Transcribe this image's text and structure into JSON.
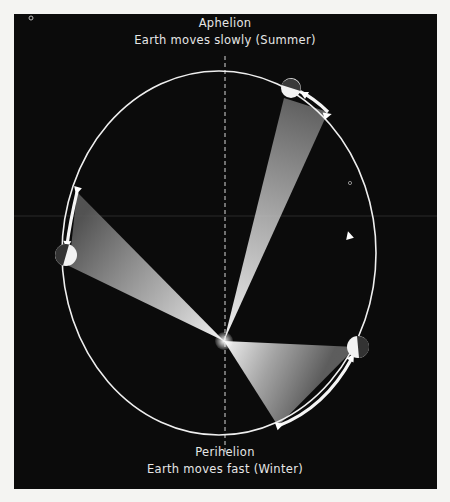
{
  "diagram": {
    "type": "orbit-diagram",
    "colors": {
      "background": "#0b0b0b",
      "page": "#f4f4f2",
      "orbit": "#f0f0f0",
      "sector_light": "#e8e8e8",
      "earth_day": "#f2f2f2",
      "earth_night": "#3a3a3a"
    },
    "aphelion": {
      "title": "Aphelion",
      "subtitle": "Earth moves slowly (Summer)"
    },
    "perihelion": {
      "title": "Perihelion",
      "subtitle": "Earth moves fast (Winter)"
    },
    "sun_focus": {
      "x": 224,
      "y": 341
    },
    "orbit": {
      "cx": 219,
      "cy": 253,
      "rx": 157,
      "ry": 182,
      "direction": "counter-clockwise"
    },
    "earth_positions": [
      {
        "name": "earth-near-aphelion",
        "x": 291,
        "y": 88
      },
      {
        "name": "earth-left",
        "x": 66,
        "y": 255
      },
      {
        "name": "earth-near-perihelion",
        "x": 358,
        "y": 347
      }
    ],
    "sectors": [
      {
        "name": "sector-aphelion",
        "points": [
          [
            224,
            341
          ],
          [
            284,
            98
          ],
          [
            328,
            112
          ]
        ]
      },
      {
        "name": "sector-left",
        "points": [
          [
            224,
            341
          ],
          [
            77,
            192
          ],
          [
            69,
            266
          ]
        ]
      },
      {
        "name": "sector-perihelion",
        "points": [
          [
            224,
            341
          ],
          [
            356,
            347
          ],
          [
            278,
            426
          ]
        ]
      }
    ]
  }
}
